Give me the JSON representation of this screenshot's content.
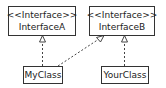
{
  "diagram": {
    "type": "UML class diagram",
    "interfaces": [
      {
        "stereotype": "<<Interface>>",
        "name": "InterfaceA"
      },
      {
        "stereotype": "<<Interface>>",
        "name": "InterfaceB"
      }
    ],
    "classes": [
      {
        "name": "MyClass"
      },
      {
        "name": "YourClass"
      }
    ],
    "relations": [
      {
        "from": "MyClass",
        "to": "InterfaceA",
        "kind": "realization"
      },
      {
        "from": "MyClass",
        "to": "InterfaceB",
        "kind": "realization"
      },
      {
        "from": "YourClass",
        "to": "InterfaceB",
        "kind": "realization"
      }
    ]
  }
}
